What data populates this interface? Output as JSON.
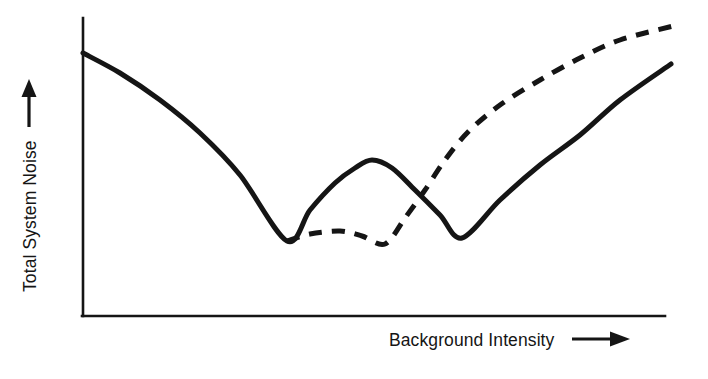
{
  "figure": {
    "title": "",
    "background_color": "#ffffff",
    "ink_color": "#151515"
  },
  "axes": {
    "y_label": "Total System Noise",
    "y_label_arrow": "up-arrow",
    "x_label": "Background Intensity",
    "x_label_arrow": "right-arrow"
  },
  "chart_data": {
    "type": "line",
    "title": "",
    "xlabel": "Background Intensity",
    "ylabel": "Total System Noise",
    "xlim": [
      0,
      100
    ],
    "ylim": [
      0,
      100
    ],
    "grid": false,
    "axis_ticks": false,
    "tick_labels": [],
    "legend": [],
    "legend_position": "none",
    "series": [
      {
        "name": "solid-curve",
        "style": "solid",
        "color": "#151515",
        "line_width_px": 5,
        "x": [
          0,
          6,
          13,
          20,
          27,
          35,
          43,
          51,
          58,
          65,
          70,
          74,
          78,
          83,
          88,
          92,
          96,
          100
        ],
        "y": [
          90,
          85,
          78,
          70,
          60,
          48,
          35,
          22,
          15,
          30,
          45,
          52,
          48,
          35,
          18,
          38,
          60,
          86
        ],
        "px_points": [
          [
            83,
            53
          ],
          [
            120,
            73
          ],
          [
            160,
            100
          ],
          [
            200,
            133
          ],
          [
            240,
            175
          ],
          [
            287,
            241
          ],
          [
            310,
            210
          ],
          [
            335,
            183
          ],
          [
            355,
            168
          ],
          [
            372,
            160
          ],
          [
            392,
            168
          ],
          [
            415,
            190
          ],
          [
            440,
            215
          ],
          [
            462,
            238
          ],
          [
            500,
            200
          ],
          [
            540,
            165
          ],
          [
            580,
            135
          ],
          [
            620,
            100
          ],
          [
            671,
            64
          ]
        ],
        "features": {
          "start_px": [
            83,
            53
          ],
          "first_minimum_px": [
            287,
            241
          ],
          "local_peak_px": [
            372,
            160
          ],
          "second_minimum_px": [
            462,
            238
          ],
          "end_px": [
            671,
            64
          ]
        }
      },
      {
        "name": "dashed-curve",
        "style": "dashed",
        "color": "#151515",
        "line_width_px": 5,
        "dash_px": [
          13,
          10
        ],
        "x": [
          35,
          40,
          44,
          48,
          52,
          56,
          60,
          65,
          70,
          76,
          82,
          88,
          94,
          100
        ],
        "y": [
          15,
          17,
          18,
          17,
          14,
          20,
          32,
          46,
          58,
          68,
          77,
          84,
          89,
          93
        ],
        "px_points": [
          [
            287,
            241
          ],
          [
            310,
            234
          ],
          [
            340,
            231
          ],
          [
            362,
            236
          ],
          [
            385,
            244
          ],
          [
            405,
            218
          ],
          [
            425,
            190
          ],
          [
            445,
            160
          ],
          [
            468,
            132
          ],
          [
            500,
            105
          ],
          [
            540,
            80
          ],
          [
            580,
            58
          ],
          [
            620,
            40
          ],
          [
            673,
            26
          ]
        ],
        "features": {
          "start_px": [
            287,
            241
          ],
          "shallow_peak_px": [
            340,
            231
          ],
          "shallow_minimum_px": [
            385,
            244
          ],
          "crossing_with_solid_px": [
            425,
            190
          ],
          "end_px": [
            673,
            26
          ]
        }
      }
    ],
    "axis_geometry": {
      "origin_px": [
        83,
        316
      ],
      "y_axis_top_px": [
        83,
        18
      ],
      "x_axis_right_px": [
        665,
        316
      ],
      "axis_line_width_px": 2.6
    }
  }
}
